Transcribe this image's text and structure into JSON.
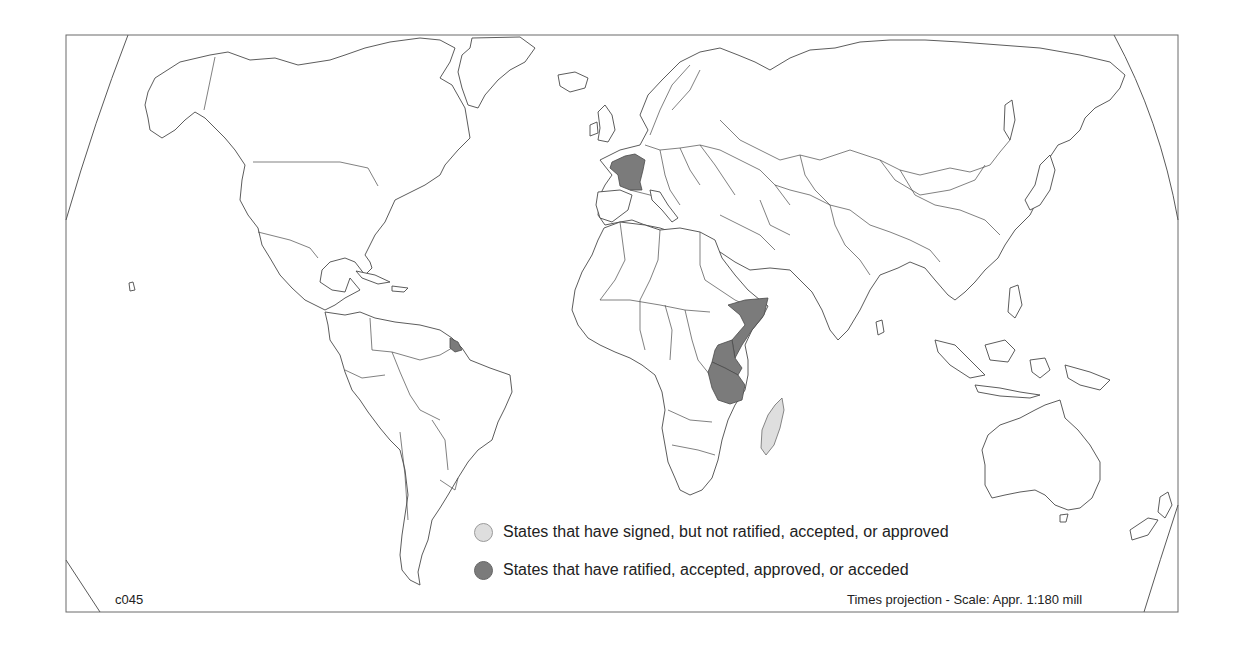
{
  "map": {
    "projection_note": "Times projection - Scale: Appr. 1:180 mill",
    "map_code": "c045",
    "colors": {
      "ratified": "#7b7b7b",
      "signed": "#dedede",
      "land": "#ffffff",
      "outline": "#4a4a4a"
    },
    "highlighted_regions": [
      {
        "name": "France",
        "status": "ratified"
      },
      {
        "name": "French Guiana",
        "status": "ratified"
      },
      {
        "name": "Somalia",
        "status": "ratified"
      },
      {
        "name": "Kenya",
        "status": "ratified"
      },
      {
        "name": "Tanzania",
        "status": "ratified"
      },
      {
        "name": "Madagascar",
        "status": "signed"
      }
    ]
  },
  "legend": {
    "items": [
      {
        "key": "signed",
        "label": "States that have signed, but not ratified, accepted, or approved",
        "color": "#dedede"
      },
      {
        "key": "ratified",
        "label": "States that have ratified, accepted, approved, or acceded",
        "color": "#7b7b7b"
      }
    ]
  }
}
